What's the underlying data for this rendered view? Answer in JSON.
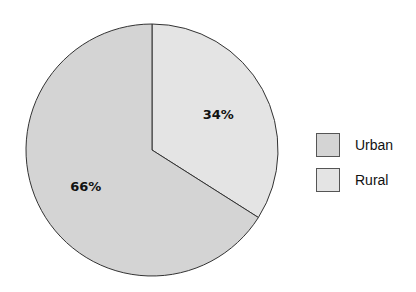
{
  "chart_data": {
    "type": "pie",
    "title": "",
    "categories": [
      "Urban",
      "Rural"
    ],
    "values": [
      66,
      34
    ],
    "labels": [
      "66%",
      "34%"
    ],
    "colors": [
      "#d4d4d4",
      "#e4e4e4"
    ],
    "start_angle_deg": 0,
    "direction": "clockwise from top for Rural",
    "legend_position": "right"
  },
  "legend": {
    "items": [
      {
        "label": "Urban",
        "color": "#d4d4d4"
      },
      {
        "label": "Rural",
        "color": "#e4e4e4"
      }
    ]
  }
}
